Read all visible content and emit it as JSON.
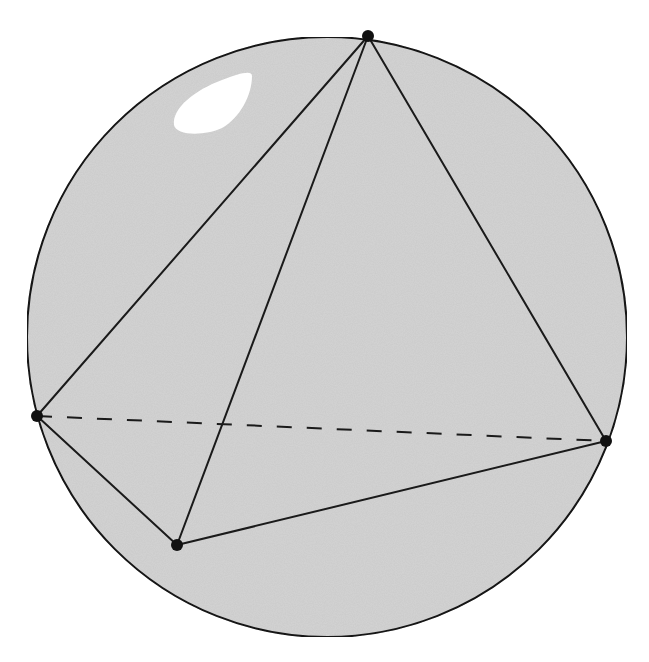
{
  "diagram": {
    "canvas": {
      "width": 649,
      "height": 662
    },
    "colors": {
      "background": "#ffffff",
      "sphere_fill": "#d4d4d4",
      "stroke": "#1a1a1a",
      "highlight": "#ffffff",
      "vertex": "#111111"
    },
    "sphere": {
      "cx": 327,
      "cy": 337,
      "r": 300,
      "stroke_width": 2
    },
    "highlight": {
      "path": "M 174 125 C 172 108, 195 90, 222 80 C 240 73, 252 70, 252 76 C 252 95, 240 118, 222 128 C 205 136, 176 136, 174 125 Z"
    },
    "vertices": [
      {
        "id": "A",
        "name": "top",
        "x": 368,
        "y": 36
      },
      {
        "id": "B",
        "name": "left",
        "x": 37,
        "y": 416
      },
      {
        "id": "C",
        "name": "right",
        "x": 606,
        "y": 441
      },
      {
        "id": "D",
        "name": "bottom-front",
        "x": 177,
        "y": 545
      }
    ],
    "vertex_radius": 6,
    "edges": [
      {
        "from": "A",
        "to": "B",
        "style": "solid"
      },
      {
        "from": "A",
        "to": "C",
        "style": "solid"
      },
      {
        "from": "A",
        "to": "D",
        "style": "solid"
      },
      {
        "from": "B",
        "to": "D",
        "style": "solid"
      },
      {
        "from": "D",
        "to": "C",
        "style": "solid"
      },
      {
        "from": "B",
        "to": "C",
        "style": "dashed"
      }
    ],
    "edge_stroke_width": 2,
    "dash_pattern": "15 15"
  }
}
